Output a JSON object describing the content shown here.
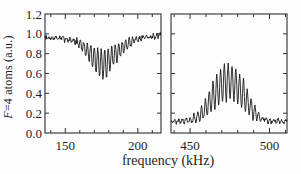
{
  "figure": {
    "background": "#fdfdfd",
    "axis_color": "#2f2f2f",
    "trace_color": "#171717",
    "ylabel_var": "F",
    "ylabel_rest": "=4 atoms (a.u.)",
    "xlabel": "frequency (kHz)"
  },
  "chart_data": {
    "type": "line",
    "title": "",
    "xlabel": "frequency (kHz)",
    "ylabel": "F=4 atoms (a.u.)",
    "ylim": [
      0.0,
      1.2
    ],
    "ytick_values": [
      0.0,
      0.2,
      0.4,
      0.6,
      0.8,
      1.0,
      1.2
    ],
    "ytick_labels": [
      "0.0",
      "0.2",
      "0.4",
      "0.6",
      "0.8",
      "1.0",
      "1.2"
    ],
    "grid": false,
    "legend": null,
    "note": "Two-panel spectroscopy trace: noisy signal oscillating between envelopes; left panel is a fringe-filled dip from a ~0.96 baseline, right panel is a fringe-filled peak above a ~0.11 baseline. Y tick labels shown only on outer left axis; tick marks on all frame edges.",
    "panels": [
      {
        "name": "left-panel-dip",
        "xlim": [
          136,
          216
        ],
        "xtick_step": 10,
        "xtick_labeled": [
          150,
          200
        ],
        "xtick_labels": [
          "150",
          "200"
        ],
        "center_khz": 176,
        "fringe_period_khz": 2.4,
        "fringe_phase": "min_at_center",
        "noise_rms": 0.012,
        "noise_seed": 7,
        "envelope_x": [
          136,
          145,
          150,
          155,
          158,
          162,
          166,
          170,
          173,
          176,
          179,
          182,
          186,
          190,
          194,
          198,
          202,
          206,
          210,
          216
        ],
        "upper_envelope": [
          0.97,
          0.97,
          0.96,
          0.955,
          0.945,
          0.93,
          0.9,
          0.87,
          0.855,
          0.85,
          0.855,
          0.87,
          0.9,
          0.925,
          0.95,
          0.965,
          0.975,
          0.98,
          0.985,
          0.99
        ],
        "lower_envelope": [
          0.945,
          0.945,
          0.94,
          0.915,
          0.88,
          0.82,
          0.73,
          0.64,
          0.575,
          0.545,
          0.575,
          0.64,
          0.73,
          0.8,
          0.87,
          0.92,
          0.945,
          0.955,
          0.96,
          0.965
        ]
      },
      {
        "name": "right-panel-peak",
        "xlim": [
          438,
          511
        ],
        "xtick_step": 10,
        "xtick_labeled": [
          450,
          500
        ],
        "xtick_labels": [
          "450",
          "500"
        ],
        "center_khz": 474,
        "fringe_period_khz": 2.4,
        "fringe_phase": "max_at_center",
        "noise_rms": 0.011,
        "noise_seed": 21,
        "envelope_x": [
          438,
          446,
          450,
          453,
          456,
          459,
          462,
          465,
          468,
          471,
          474,
          477,
          480,
          483,
          486,
          489,
          492,
          495,
          498,
          502,
          511
        ],
        "upper_envelope": [
          0.135,
          0.14,
          0.155,
          0.18,
          0.23,
          0.31,
          0.42,
          0.53,
          0.62,
          0.675,
          0.695,
          0.68,
          0.63,
          0.55,
          0.44,
          0.33,
          0.24,
          0.175,
          0.15,
          0.135,
          0.13
        ],
        "lower_envelope": [
          0.105,
          0.105,
          0.11,
          0.115,
          0.125,
          0.15,
          0.19,
          0.235,
          0.28,
          0.32,
          0.345,
          0.33,
          0.295,
          0.25,
          0.2,
          0.16,
          0.13,
          0.115,
          0.105,
          0.1,
          0.1
        ]
      }
    ]
  }
}
